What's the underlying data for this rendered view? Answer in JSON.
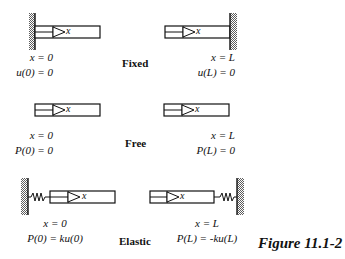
{
  "figure_caption": "Figure 11.1-2",
  "cases": [
    {
      "name": "Fixed",
      "left": {
        "support": "wall",
        "line1": "x = 0",
        "line2": "u(0) = 0"
      },
      "right": {
        "support": "wall",
        "line1": "x = L",
        "line2": "u(L) = 0"
      }
    },
    {
      "name": "Free",
      "left": {
        "support": "none",
        "line1": "x = 0",
        "line2": "P(0) = 0"
      },
      "right": {
        "support": "none",
        "line1": "x = L",
        "line2": "P(L) = 0"
      }
    },
    {
      "name": "Elastic",
      "left": {
        "support": "spring-wall",
        "line1": "x = 0",
        "line2": "P(0) = ku(0)"
      },
      "right": {
        "support": "spring-wall",
        "line1": "x = L",
        "line2": "P(L) = -ku(L)"
      }
    }
  ],
  "axis_label": "x",
  "colors": {
    "ink": "#111111",
    "background": "#ffffff"
  }
}
